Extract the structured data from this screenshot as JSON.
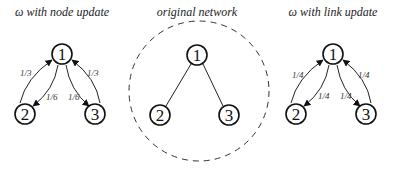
{
  "panels": {
    "left": {
      "title": "ω with node update",
      "nodes": [
        {
          "id": "1",
          "x": 62,
          "y": 54
        },
        {
          "id": "2",
          "x": 25,
          "y": 114
        },
        {
          "id": "3",
          "x": 95,
          "y": 114
        }
      ],
      "weights": {
        "w21": "1/3",
        "w12": "1/6",
        "w13": "1/6",
        "w31": "1/3"
      }
    },
    "middle": {
      "title": "original network",
      "nodes": [
        {
          "id": "1",
          "x": 197,
          "y": 55
        },
        {
          "id": "2",
          "x": 160,
          "y": 115
        },
        {
          "id": "3",
          "x": 229,
          "y": 115
        }
      ],
      "edges": [
        [
          "1",
          "2"
        ],
        [
          "1",
          "3"
        ]
      ],
      "boundary": "dashed-circle"
    },
    "right": {
      "title": "ω with link update",
      "nodes": [
        {
          "id": "1",
          "x": 333,
          "y": 54
        },
        {
          "id": "2",
          "x": 296,
          "y": 114
        },
        {
          "id": "3",
          "x": 366,
          "y": 114
        }
      ],
      "weights": {
        "w21": "1/4",
        "w12": "1/4",
        "w13": "1/4",
        "w31": "1/4"
      }
    }
  }
}
